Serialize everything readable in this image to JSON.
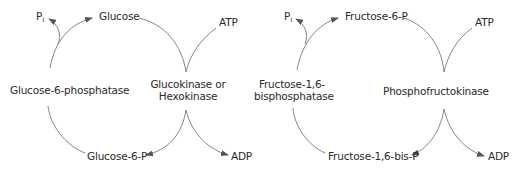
{
  "cycles": [
    {
      "name": "glucose-cycle",
      "top_product": "Glucose",
      "bottom_product": "Glucose-6-P",
      "left_enzyme": "Glucose-6-phosphatase",
      "right_enzyme_line1": "Glucokinase or",
      "right_enzyme_line2": "Hexokinase",
      "released": "P",
      "released_sub": "i",
      "cofactor_in": "ATP",
      "cofactor_out": "ADP"
    },
    {
      "name": "fructose-cycle",
      "top_product": "Fructose-6-P",
      "bottom_product": "Fructose-1,6-bis-P",
      "left_enzyme_line1": "Fructose-1,6-",
      "left_enzyme_line2": "bisphosphatase",
      "right_enzyme": "Phosphofructokinase",
      "released": "P",
      "released_sub": "i",
      "cofactor_in": "ATP",
      "cofactor_out": "ADP"
    }
  ],
  "colors": {
    "line": "#555555",
    "text": "#2a2a2a"
  }
}
